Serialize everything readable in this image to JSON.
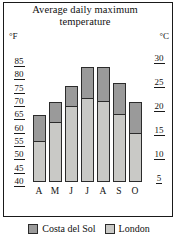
{
  "chart_data": {
    "type": "bar",
    "title": "Average daily maximum temperature",
    "xlabel": "",
    "ylabel": "°F",
    "ylabel_right": "°C",
    "grid": false,
    "legend_position": "bottom",
    "categories": [
      "A",
      "M",
      "J",
      "J",
      "A",
      "S",
      "O"
    ],
    "ylim": [
      40,
      85
    ],
    "ylim_right": [
      4.4,
      29.4
    ],
    "yticks_left": [
      85,
      80,
      75,
      70,
      65,
      60,
      55,
      50,
      45,
      40
    ],
    "yticks_right": [
      30,
      25,
      20,
      15,
      10,
      5
    ],
    "series": [
      {
        "name": "Costa del Sol",
        "values": [
          65,
          70,
          76,
          83,
          83,
          77,
          70
        ],
        "color": "#9a9a9a"
      },
      {
        "name": "London",
        "values": [
          55,
          62,
          68,
          71,
          70,
          65,
          58
        ],
        "color": "#c9c9c6"
      }
    ]
  },
  "axes": {
    "unit_left": "°F",
    "unit_right": "°C"
  },
  "legend": {
    "items": [
      {
        "label": "Costa del Sol",
        "color": "#9a9a9a"
      },
      {
        "label": "London",
        "color": "#c9c9c6"
      }
    ]
  }
}
